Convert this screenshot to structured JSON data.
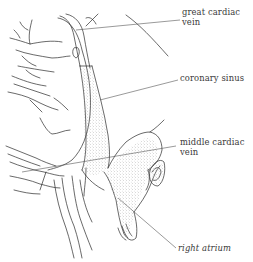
{
  "diagram": {
    "colors": {
      "background": "#ffffff",
      "line": "#2a2a2a",
      "leader": "#555555",
      "stipple": "#9a9a9a",
      "label_text": "#3a3a3a"
    },
    "labels": [
      {
        "id": "great-cardiac-vein",
        "line1": "great cardiac",
        "line2": "vein"
      },
      {
        "id": "coronary-sinus",
        "line1": "coronary sinus",
        "line2": ""
      },
      {
        "id": "middle-cardiac-vein",
        "line1": "middle cardiac",
        "line2": "vein"
      },
      {
        "id": "right-atrium",
        "line1": "right atrium",
        "line2": ""
      }
    ]
  }
}
